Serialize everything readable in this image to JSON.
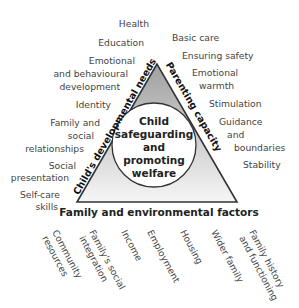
{
  "diagram": {
    "center_label": [
      "Child",
      "safeguarding",
      "and",
      "promoting",
      "welfare"
    ],
    "sides": {
      "left": "Child's developmental needs",
      "right": "Parenting capacity",
      "bottom": "Family and environmental factors"
    },
    "left_items": [
      {
        "lines": [
          "Health"
        ]
      },
      {
        "lines": [
          "Education"
        ]
      },
      {
        "lines": [
          "Emotional",
          "and behavioural",
          "development"
        ]
      },
      {
        "lines": [
          "Identity"
        ]
      },
      {
        "lines": [
          "Family and",
          "social",
          "relationships"
        ]
      },
      {
        "lines": [
          "Social",
          "presentation"
        ]
      },
      {
        "lines": [
          "Self-care",
          "skills"
        ]
      }
    ],
    "right_items": [
      {
        "lines": [
          "Basic care"
        ]
      },
      {
        "lines": [
          "Ensuring safety"
        ]
      },
      {
        "lines": [
          "Emotional",
          "warmth"
        ]
      },
      {
        "lines": [
          "Stimulation"
        ]
      },
      {
        "lines": [
          "Guidance",
          "and",
          "boundaries"
        ]
      },
      {
        "lines": [
          "Stability"
        ]
      }
    ],
    "bottom_items": [
      {
        "lines": [
          "Community",
          "resources"
        ]
      },
      {
        "lines": [
          "Family's social",
          "integration"
        ]
      },
      {
        "lines": [
          "Income"
        ]
      },
      {
        "lines": [
          "Employment"
        ]
      },
      {
        "lines": [
          "Housing"
        ]
      },
      {
        "lines": [
          "Wider family"
        ]
      },
      {
        "lines": [
          "Family history",
          "and functioning"
        ]
      }
    ],
    "colors": {
      "triangle_top": "#a8a8a8",
      "triangle_bottom": "#f4f4f4",
      "outline": "#333333",
      "circle_fill": "#ffffff"
    }
  }
}
